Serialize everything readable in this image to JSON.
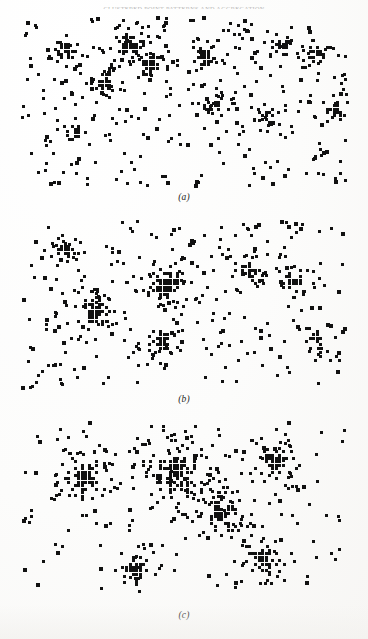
{
  "document": {
    "running_header": "CLUSTERED POINT PATTERNS AND AGGREGATION",
    "background_color": "#fdfdfc",
    "ink_color": "#111111"
  },
  "figure": {
    "name": "three-panel-cluster-simulation",
    "panel_count": 3,
    "panels": [
      {
        "id": "a",
        "label": "(a)"
      },
      {
        "id": "b",
        "label": "(b)"
      },
      {
        "id": "c",
        "label": "(c)"
      }
    ]
  },
  "chart_data": {
    "type": "scatter",
    "title": "",
    "subtitle": "",
    "xlabel": "",
    "ylabel": "",
    "grid": false,
    "legend": null,
    "axis_visible": false,
    "marker": {
      "shape": "square",
      "color": "#111111",
      "size_px": 3.2,
      "cluster_size_px": 3.4
    },
    "xlim": [
      0,
      332
    ],
    "ylim": [
      0,
      176
    ],
    "panels": [
      {
        "id": "a",
        "label": "(a)",
        "description": "Early stage: many small clusters plus dense scattered background points",
        "n_points": 620,
        "n_background": 300,
        "n_clusters": 11,
        "cluster_spread": 9.5,
        "clusters": [
          {
            "cx": 48,
            "cy": 36,
            "n": 34,
            "r": 11
          },
          {
            "cx": 112,
            "cy": 30,
            "n": 52,
            "r": 14
          },
          {
            "cx": 132,
            "cy": 52,
            "n": 40,
            "r": 12
          },
          {
            "cx": 186,
            "cy": 44,
            "n": 30,
            "r": 11
          },
          {
            "cx": 196,
            "cy": 92,
            "n": 26,
            "r": 10
          },
          {
            "cx": 262,
            "cy": 30,
            "n": 30,
            "r": 11
          },
          {
            "cx": 300,
            "cy": 40,
            "n": 36,
            "r": 12
          },
          {
            "cx": 86,
            "cy": 70,
            "n": 26,
            "r": 10
          },
          {
            "cx": 60,
            "cy": 118,
            "n": 18,
            "r": 9
          },
          {
            "cx": 248,
            "cy": 104,
            "n": 20,
            "r": 9
          },
          {
            "cx": 318,
            "cy": 96,
            "n": 22,
            "r": 10
          }
        ]
      },
      {
        "id": "b",
        "label": "(b)",
        "description": "Intermediate stage: fewer, denser clusters with a sparser background",
        "n_points": 540,
        "n_background": 250,
        "n_clusters": 7,
        "cluster_spread": 11.5,
        "clusters": [
          {
            "cx": 46,
            "cy": 36,
            "n": 26,
            "r": 10
          },
          {
            "cx": 78,
            "cy": 96,
            "n": 62,
            "r": 16
          },
          {
            "cx": 150,
            "cy": 70,
            "n": 74,
            "r": 18
          },
          {
            "cx": 144,
            "cy": 126,
            "n": 34,
            "r": 12
          },
          {
            "cx": 232,
            "cy": 56,
            "n": 46,
            "r": 14
          },
          {
            "cx": 276,
            "cy": 66,
            "n": 40,
            "r": 13
          },
          {
            "cx": 296,
            "cy": 122,
            "n": 24,
            "r": 10
          }
        ]
      },
      {
        "id": "c",
        "label": "(c)",
        "description": "Late stage: a few large consolidated clusters with a thin background scatter",
        "n_points": 470,
        "n_background": 170,
        "n_clusters": 6,
        "cluster_spread": 15.5,
        "clusters": [
          {
            "cx": 66,
            "cy": 60,
            "n": 96,
            "r": 21
          },
          {
            "cx": 158,
            "cy": 54,
            "n": 150,
            "r": 27
          },
          {
            "cx": 206,
            "cy": 96,
            "n": 86,
            "r": 20
          },
          {
            "cx": 258,
            "cy": 44,
            "n": 72,
            "r": 18
          },
          {
            "cx": 118,
            "cy": 150,
            "n": 40,
            "r": 13
          },
          {
            "cx": 246,
            "cy": 142,
            "n": 52,
            "r": 15
          }
        ]
      }
    ]
  }
}
